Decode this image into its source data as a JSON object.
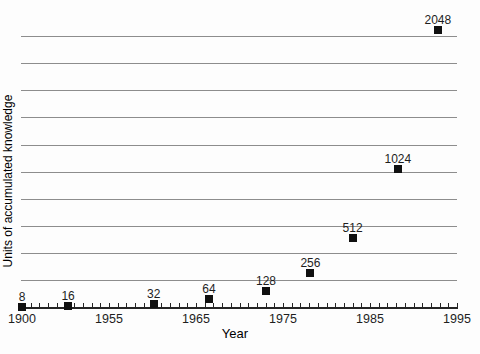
{
  "figure": {
    "background": "#fdfdfd",
    "text_color": "#1e1e1e",
    "gridline_color": "#8d8d8d",
    "axis_color": "#242424",
    "marker_color": "#101010"
  },
  "chart_data": {
    "type": "scatter",
    "title": "",
    "xlabel": "Year",
    "ylabel": "Units of accumulated knowledge",
    "grid": "horizontal-only",
    "legend": null,
    "x_axis": {
      "tick_labels": [
        "1900",
        "1955",
        "1965",
        "1975",
        "1985",
        "1995"
      ],
      "tick_fracs": [
        0,
        0.2,
        0.4,
        0.6,
        0.8,
        1
      ],
      "minor_tick_intervals": 50,
      "scale_note": "axis compressed before 1955; one decade per major interval after 1955"
    },
    "y_axis": {
      "range": [
        0,
        2170
      ],
      "gridline_values": [
        200,
        400,
        600,
        800,
        1000,
        1200,
        1400,
        1600,
        1800,
        2000
      ],
      "tick_labels": []
    },
    "points": [
      {
        "label": "8",
        "value": 8,
        "x_frac": 0.0,
        "approx_year": 1900
      },
      {
        "label": "16",
        "value": 16,
        "x_frac": 0.106,
        "approx_year": 1950
      },
      {
        "label": "32",
        "value": 32,
        "x_frac": 0.303,
        "approx_year": 1960
      },
      {
        "label": "64",
        "value": 64,
        "x_frac": 0.43,
        "approx_year": 1966
      },
      {
        "label": "128",
        "value": 128,
        "x_frac": 0.561,
        "approx_year": 1973
      },
      {
        "label": "256",
        "value": 256,
        "x_frac": 0.663,
        "approx_year": 1978
      },
      {
        "label": "512",
        "value": 512,
        "x_frac": 0.76,
        "approx_year": 1983
      },
      {
        "label": "1024",
        "value": 1024,
        "x_frac": 0.864,
        "approx_year": 1988
      },
      {
        "label": "2048",
        "value": 2048,
        "x_frac": 0.956,
        "approx_year": 1993
      }
    ]
  }
}
